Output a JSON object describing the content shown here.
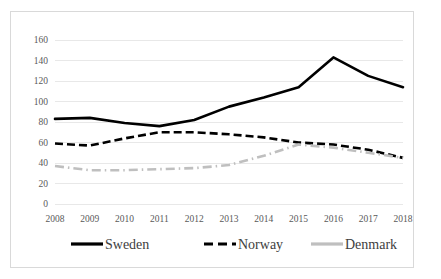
{
  "chart_data": {
    "type": "line",
    "title": "",
    "xlabel": "",
    "ylabel": "",
    "categories": [
      "2008",
      "2009",
      "2010",
      "2011",
      "2012",
      "2013",
      "2014",
      "2015",
      "2016",
      "2017",
      "2018"
    ],
    "ylim": [
      0,
      160
    ],
    "ytick_step": 20,
    "yticks": [
      "0",
      "20",
      "40",
      "60",
      "80",
      "100",
      "120",
      "140",
      "160"
    ],
    "grid": true,
    "legend_position": "bottom",
    "series": [
      {
        "name": "Sweden",
        "style": "solid",
        "color": "#000000",
        "values": [
          83,
          84,
          79,
          76,
          82,
          95,
          104,
          114,
          143,
          125,
          114
        ]
      },
      {
        "name": "Norway",
        "style": "dashed",
        "color": "#000000",
        "values": [
          59,
          57,
          64,
          70,
          70,
          68,
          65,
          60,
          58,
          53,
          45
        ]
      },
      {
        "name": "Denmark",
        "style": "dash-dot",
        "color": "#BFBFBF",
        "values": [
          37,
          33,
          33,
          34,
          35,
          38,
          47,
          58,
          55,
          50,
          45
        ]
      }
    ]
  },
  "legend": {
    "items": [
      {
        "label": "Sweden"
      },
      {
        "label": "Norway"
      },
      {
        "label": "Denmark"
      }
    ]
  }
}
